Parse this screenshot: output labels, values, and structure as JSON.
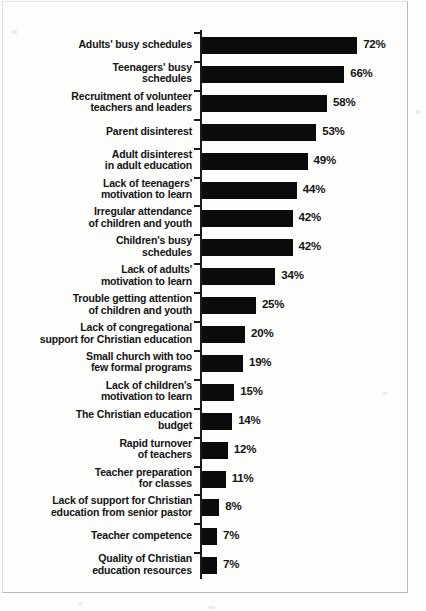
{
  "chart_data": {
    "type": "bar",
    "orientation": "horizontal",
    "title": "",
    "subtitle": "",
    "xlabel": "",
    "ylabel": "",
    "xlim": [
      0,
      72
    ],
    "grid": false,
    "legend": null,
    "value_suffix": "%",
    "categories": [
      "Adults' busy schedules",
      "Teenagers' busy schedules",
      "Recruitment of volunteer teachers and leaders",
      "Parent disinterest",
      "Adult disinterest in adult education",
      "Lack of teenagers' motivation to learn",
      "Irregular attendance of children and youth",
      "Children's busy schedules",
      "Lack of adults' motivation to learn",
      "Trouble getting attention of children and youth",
      "Lack of congregational support for Christian education",
      "Small church with too few formal programs",
      "Lack of children's motivation to learn",
      "The Christian education budget",
      "Rapid turnover of teachers",
      "Teacher preparation for classes",
      "Lack of support for Christian education from senior pastor",
      "Teacher competence",
      "Quality of Christian education resources"
    ],
    "values": [
      72,
      66,
      58,
      53,
      49,
      44,
      42,
      42,
      34,
      25,
      20,
      19,
      15,
      14,
      12,
      11,
      8,
      7,
      7
    ]
  },
  "bars": [
    {
      "label_lines": [
        "Adults' busy schedules"
      ],
      "value": 72,
      "value_label": "72%"
    },
    {
      "label_lines": [
        "Teenagers' busy",
        "schedules"
      ],
      "value": 66,
      "value_label": "66%"
    },
    {
      "label_lines": [
        "Recruitment of volunteer",
        "teachers and leaders"
      ],
      "value": 58,
      "value_label": "58%"
    },
    {
      "label_lines": [
        "Parent disinterest"
      ],
      "value": 53,
      "value_label": "53%"
    },
    {
      "label_lines": [
        "Adult disinterest",
        "in adult education"
      ],
      "value": 49,
      "value_label": "49%"
    },
    {
      "label_lines": [
        "Lack of teenagers'",
        "motivation to learn"
      ],
      "value": 44,
      "value_label": "44%"
    },
    {
      "label_lines": [
        "Irregular attendance",
        "of children and youth"
      ],
      "value": 42,
      "value_label": "42%"
    },
    {
      "label_lines": [
        "Children's busy",
        "schedules"
      ],
      "value": 42,
      "value_label": "42%"
    },
    {
      "label_lines": [
        "Lack of adults'",
        "motivation to learn"
      ],
      "value": 34,
      "value_label": "34%"
    },
    {
      "label_lines": [
        "Trouble getting attention",
        "of children and youth"
      ],
      "value": 25,
      "value_label": "25%"
    },
    {
      "label_lines": [
        "Lack of congregational",
        "support for Christian education"
      ],
      "value": 20,
      "value_label": "20%"
    },
    {
      "label_lines": [
        "Small church with too",
        "few formal programs"
      ],
      "value": 19,
      "value_label": "19%"
    },
    {
      "label_lines": [
        "Lack of children's",
        "motivation to learn"
      ],
      "value": 15,
      "value_label": "15%"
    },
    {
      "label_lines": [
        "The Christian education",
        "budget"
      ],
      "value": 14,
      "value_label": "14%"
    },
    {
      "label_lines": [
        "Rapid turnover",
        "of teachers"
      ],
      "value": 12,
      "value_label": "12%"
    },
    {
      "label_lines": [
        "Teacher preparation",
        "for classes"
      ],
      "value": 11,
      "value_label": "11%"
    },
    {
      "label_lines": [
        "Lack of support for Christian",
        "education from senior pastor"
      ],
      "value": 8,
      "value_label": "8%"
    },
    {
      "label_lines": [
        "Teacher competence"
      ],
      "value": 7,
      "value_label": "7%"
    },
    {
      "label_lines": [
        "Quality of Christian",
        "education resources"
      ],
      "value": 7,
      "value_label": "7%"
    }
  ],
  "style": {
    "bar_color": "#0b0b0b",
    "axis_color": "#1a1a1a",
    "text_color": "#141414",
    "background_color": "#fdfdfc"
  },
  "geometry": {
    "axis_x": 200,
    "first_row_top": 30,
    "row_pitch": 28.9,
    "px_per_unit": 2.155
  }
}
